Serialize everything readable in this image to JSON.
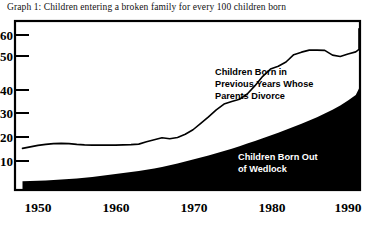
{
  "title": "Graph 1: Children entering a broken family for every 100 children born",
  "colors": {
    "ink": "#000000",
    "background": "#ffffff",
    "wedlock_fill": "#000000",
    "divorce_line": "#000000",
    "label_light": "#ffffff"
  },
  "annotations": {
    "divorce": {
      "lines": [
        "Children Born in",
        "Previous Years Whose",
        "Parents Divorce"
      ],
      "style": "dark"
    },
    "wedlock": {
      "lines": [
        "Children Born Out",
        "of Wedlock"
      ],
      "style": "light"
    }
  },
  "chart_data": {
    "type": "area",
    "title": "Graph 1: Children entering a broken family for every 100 children born",
    "xlabel": "",
    "ylabel": "",
    "xlim": [
      1948,
      1992
    ],
    "ylim": [
      0,
      66
    ],
    "grid": false,
    "legend": "annotations-inline",
    "xticks": [
      1950,
      1960,
      1970,
      1980,
      1990
    ],
    "xtick_labels": [
      "1950",
      "1960",
      "1970",
      "1980",
      "1990"
    ],
    "yticks": [
      10,
      20,
      30,
      40,
      50,
      60
    ],
    "ytick_labels": [
      "10",
      "20",
      "30",
      "40",
      "50",
      "60"
    ],
    "x": [
      1948,
      1949,
      1950,
      1951,
      1952,
      1953,
      1954,
      1955,
      1956,
      1957,
      1958,
      1959,
      1960,
      1961,
      1962,
      1963,
      1964,
      1965,
      1966,
      1967,
      1968,
      1969,
      1970,
      1971,
      1972,
      1973,
      1974,
      1975,
      1976,
      1977,
      1978,
      1979,
      1980,
      1981,
      1982,
      1983,
      1984,
      1985,
      1986,
      1987,
      1988,
      1989,
      1990,
      1991,
      1992
    ],
    "series": [
      {
        "name": "Children Born Out of Wedlock",
        "render": "filled-area",
        "values": [
          2.0,
          2.1,
          2.2,
          2.3,
          2.5,
          2.7,
          2.9,
          3.1,
          3.4,
          3.7,
          4.0,
          4.4,
          4.8,
          5.2,
          5.6,
          6.0,
          6.5,
          7.0,
          7.6,
          8.3,
          9.0,
          9.8,
          10.6,
          11.4,
          12.2,
          13.1,
          14.0,
          14.9,
          15.9,
          16.9,
          17.9,
          19.0,
          20.1,
          21.2,
          22.4,
          23.6,
          24.8,
          26.1,
          27.4,
          28.8,
          30.3,
          32.0,
          34.0,
          36.2,
          38.8
        ]
      },
      {
        "name": "Total: Children Born Out of Wedlock plus Children Born in Previous Years Whose Parents Divorce",
        "render": "line",
        "values": [
          15.0,
          15.6,
          16.2,
          16.6,
          16.9,
          17.0,
          16.9,
          16.6,
          16.4,
          16.3,
          16.3,
          16.3,
          16.3,
          16.4,
          16.5,
          16.7,
          17.6,
          18.4,
          19.2,
          18.8,
          19.3,
          20.6,
          22.4,
          24.9,
          27.5,
          30.3,
          32.6,
          33.6,
          34.5,
          36.6,
          39.9,
          43.6,
          46.5,
          47.6,
          49.3,
          52.2,
          53.2,
          54.0,
          54.0,
          53.9,
          52.0,
          51.5,
          52.5,
          53.3,
          54.3
        ]
      }
    ],
    "series_tail": {
      "note": "line continues rising to the right frame edge",
      "x": [
        1992,
        1993,
        1994,
        1995,
        1996
      ],
      "total": [
        54.3,
        55.5,
        57.4,
        59.0,
        62.5
      ],
      "wedlock": [
        38.8,
        39.2,
        39.5,
        39.8,
        40.0
      ]
    }
  }
}
